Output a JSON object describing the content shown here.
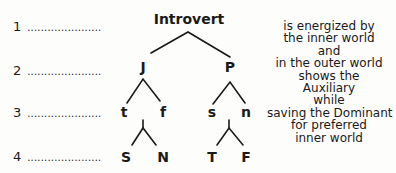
{
  "levels": [
    {
      "number": "1",
      "dots": "......................"
    },
    {
      "number": "2",
      "dots": "......................"
    },
    {
      "number": "3",
      "dots": "......................"
    },
    {
      "number": "4",
      "dots": "......................"
    }
  ],
  "tree": {
    "root": "Introvert",
    "level2": {
      "left": "J",
      "right": "P"
    },
    "level3": {
      "left_left": "t",
      "left_right": "f",
      "right_left": "s",
      "right_right": "n"
    },
    "level4": {
      "left_left": "S",
      "left_right": "N",
      "right_left": "T",
      "right_right": "F"
    }
  },
  "description": {
    "lines": [
      "is energized by",
      "the inner world",
      "and",
      "in the outer world",
      "shows the",
      "Auxiliary",
      "while",
      "saving the Dominant",
      "for preferred",
      "inner world"
    ]
  }
}
